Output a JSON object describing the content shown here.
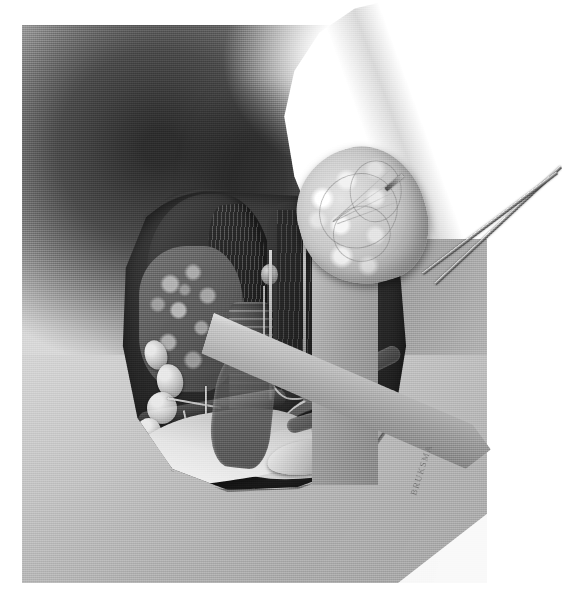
{
  "figure": {
    "kind": "medical-illustration",
    "style": "grayscale halftone airbrush",
    "orientation": "patient supine, head to upper right",
    "signature": "BRUKSMA",
    "canvas": {
      "width": 536,
      "height": 597,
      "background": "#ffffff"
    },
    "plate": {
      "x": 22,
      "y": 25,
      "width": 465,
      "height": 558
    }
  },
  "palette": {
    "paper": "#ffffff",
    "skin_light": "#c9c9c9",
    "skin_mid": "#9d9d9d",
    "skin_shadow": "#2e2e2e",
    "wound_cavity": "#2c2c2c",
    "muscle_dark": "#303030",
    "gland_nodular": "#787878",
    "specimen_pale": "#e3e3e3",
    "bone_white": "#fafafa",
    "instrument_steel": "#b4b4b4",
    "signature_ink": "#6b6b6b"
  },
  "regions": {
    "background": {
      "label": "Neck and upper chest skin surface",
      "tone": "graded mid-gray with deep submandibular shadow"
    },
    "jaw_cutout": {
      "label": "Chin and mandible silhouette",
      "tone": "paper white"
    },
    "wound": {
      "label": "Open surgical field (collar incision)",
      "tone": "deep shadowed cavity"
    }
  },
  "structures": [
    {
      "name": "strap-muscle-flap",
      "label": "Retracted strap muscle flap",
      "position": "upper left of field"
    },
    {
      "name": "nodular-gland-tissue",
      "label": "Nodular glandular tissue",
      "position": "left of field"
    },
    {
      "name": "muscle-column-right",
      "label": "Divided muscle column",
      "position": "center-upper field"
    },
    {
      "name": "lymph-node-chain",
      "label": "Chain of lymph nodes",
      "position": "lower left of field"
    },
    {
      "name": "trachea",
      "label": "Trachea with cartilage rings",
      "position": "center of field"
    },
    {
      "name": "vessel-loop",
      "label": "Looped vessel on traction",
      "position": "center of field"
    },
    {
      "name": "great-vessel",
      "label": "Great vessel (carotid / jugular)",
      "position": "sweeping to lower right"
    },
    {
      "name": "clavicle-sternum",
      "label": "Clavicle and sternal notch",
      "position": "inferior margin of field"
    },
    {
      "name": "paired-ducts",
      "label": "Paired vessels and ducts",
      "position": "lower right of field"
    }
  ],
  "instruments": [
    {
      "name": "specimen-forceps",
      "label": "Tissue forceps grasping specimen",
      "material": "stainless steel",
      "position": "upper right, entering from outside the field"
    },
    {
      "name": "retractor-vertical",
      "label": "Vertical retractor blade",
      "material": "stainless steel",
      "position": "right margin of field"
    },
    {
      "name": "retractor-blade",
      "label": "Flat retractor blade",
      "material": "stainless steel",
      "position": "crossing the field diagonally to lower right"
    }
  ],
  "specimen": {
    "name": "excised-nodular-lobe",
    "label": "Excised nodular thyroid lobe",
    "surface": "multinodular, lobulated, pale with granular texture",
    "held_by": "specimen-forceps"
  },
  "callouts": []
}
